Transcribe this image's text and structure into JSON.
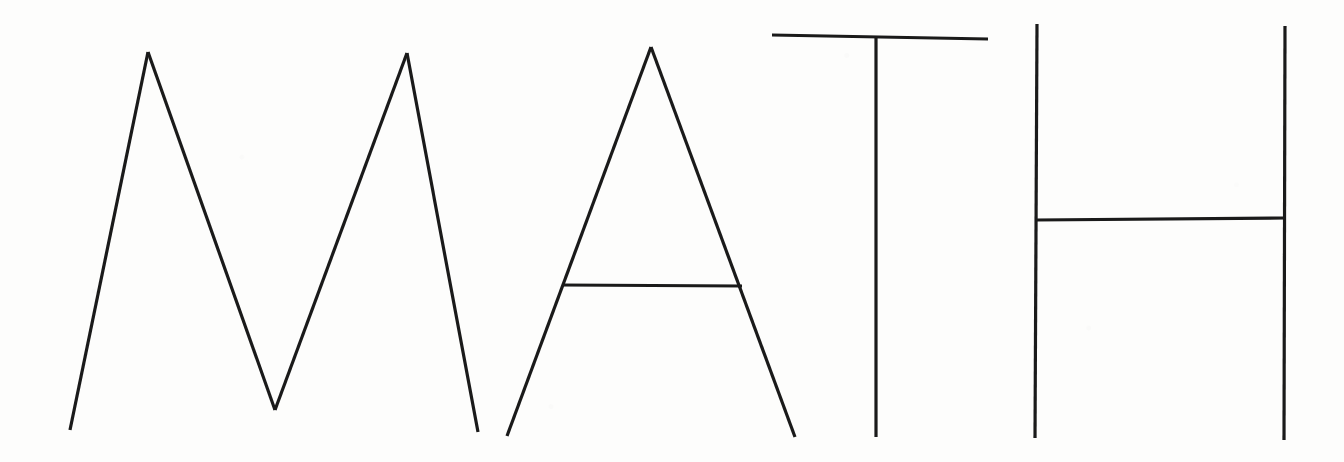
{
  "image": {
    "title": "MATH",
    "description": "Hand-drawn block letters spelling MATH in thin black ink on white paper",
    "width": 1344,
    "height": 462,
    "background_color": "#fdfdfc",
    "ink_color": "#1a1a1a",
    "stroke_width": 3.2
  },
  "word": {
    "text": "MATH",
    "letters": [
      {
        "char": "M",
        "name": "letter-m",
        "strokes": [
          {
            "name": "m-left-leg",
            "points": [
              [
                70,
                430
              ],
              [
                148,
                52
              ]
            ]
          },
          {
            "name": "m-left-diagonal",
            "points": [
              [
                148,
                52
              ],
              [
                275,
                410
              ]
            ]
          },
          {
            "name": "m-right-diagonal",
            "points": [
              [
                275,
                410
              ],
              [
                407,
                53
              ]
            ]
          },
          {
            "name": "m-right-leg",
            "points": [
              [
                407,
                53
              ],
              [
                478,
                432
              ]
            ]
          }
        ]
      },
      {
        "char": "A",
        "name": "letter-a",
        "strokes": [
          {
            "name": "a-left-diagonal",
            "points": [
              [
                507,
                436
              ],
              [
                651,
                47
              ]
            ]
          },
          {
            "name": "a-right-diagonal",
            "points": [
              [
                651,
                47
              ],
              [
                795,
                437
              ]
            ]
          },
          {
            "name": "a-crossbar",
            "points": [
              [
                562,
                285
              ],
              [
                742,
                286
              ]
            ]
          }
        ]
      },
      {
        "char": "T",
        "name": "letter-t",
        "strokes": [
          {
            "name": "t-top-bar",
            "points": [
              [
                772,
                35
              ],
              [
                988,
                39
              ]
            ]
          },
          {
            "name": "t-stem",
            "points": [
              [
                876,
                38
              ],
              [
                876,
                437
              ]
            ]
          }
        ]
      },
      {
        "char": "H",
        "name": "letter-h",
        "strokes": [
          {
            "name": "h-left-stem",
            "points": [
              [
                1037,
                24
              ],
              [
                1035,
                438
              ]
            ]
          },
          {
            "name": "h-right-stem",
            "points": [
              [
                1285,
                26
              ],
              [
                1284,
                440
              ]
            ]
          },
          {
            "name": "h-crossbar",
            "points": [
              [
                1036,
                220
              ],
              [
                1285,
                218
              ]
            ]
          }
        ]
      }
    ]
  }
}
